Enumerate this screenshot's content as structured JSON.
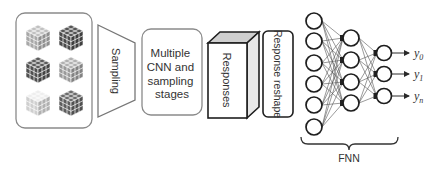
{
  "diagram": {
    "stages": [
      {
        "id": "input-images",
        "label": ""
      },
      {
        "id": "sampling",
        "label": "Sampling"
      },
      {
        "id": "cnn-stages",
        "label_lines": [
          "Multiple",
          "CNN and",
          "sampling",
          "stages"
        ]
      },
      {
        "id": "responses",
        "label": "Responses"
      },
      {
        "id": "response-reshape",
        "label": "Response reshape"
      },
      {
        "id": "fnn",
        "label": "FNN"
      }
    ],
    "cubes": [
      {
        "shade": "#a8a8a8"
      },
      {
        "shade": "#4a4a4a"
      },
      {
        "shade": "#505050"
      },
      {
        "shade": "#9a9a9a"
      },
      {
        "shade": "#cfcfcf"
      },
      {
        "shade": "#5e5e5e"
      }
    ],
    "network": {
      "layers": [
        6,
        4,
        3
      ],
      "outputs": [
        "y0",
        "y1",
        "yn"
      ],
      "output_labels": {
        "y0_base": "y",
        "y0_sub": "0",
        "y1_base": "y",
        "y1_sub": "1",
        "yn_base": "y",
        "yn_sub": "n"
      }
    },
    "colors": {
      "stroke": "#2a2a2a",
      "light_stroke": "#8a8a8a"
    }
  }
}
